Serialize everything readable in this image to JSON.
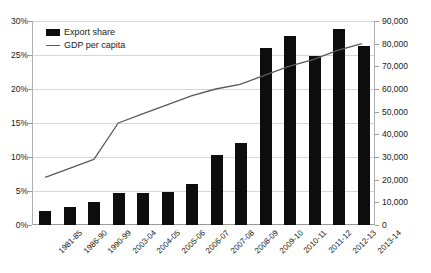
{
  "chart_data": {
    "type": "bar",
    "title": "",
    "subtitle": "",
    "xlabel": "",
    "ylabel": "",
    "y2label": "",
    "grid": true,
    "legend_position": "top-left",
    "categories": [
      "1981-85",
      "1986-90",
      "1990-99",
      "2003-04",
      "2004-05",
      "2005-06",
      "2006-07",
      "2007-08",
      "2008-09",
      "2009-10",
      "2010-11",
      "2011-12",
      "2012-13",
      "2013-14"
    ],
    "ylim": [
      0,
      30
    ],
    "yticks": [
      "0%",
      "5%",
      "10%",
      "15%",
      "20%",
      "25%",
      "30%"
    ],
    "ytick_values": [
      0,
      5,
      10,
      15,
      20,
      25,
      30
    ],
    "y2lim": [
      0,
      90000
    ],
    "y2ticks": [
      "0",
      "10,000",
      "20,000",
      "30,000",
      "40,000",
      "50,000",
      "60,000",
      "70,000",
      "80,000",
      "90,000"
    ],
    "y2tick_values": [
      0,
      10000,
      20000,
      30000,
      40000,
      50000,
      60000,
      70000,
      80000,
      90000
    ],
    "series": [
      {
        "name": "Export share",
        "kind": "bar",
        "axis": "left",
        "unit": "%",
        "color": "#0d0d0d",
        "values": [
          2.0,
          2.7,
          3.4,
          4.7,
          4.7,
          4.8,
          6.0,
          10.3,
          12.0,
          26.0,
          27.8,
          24.8,
          28.8,
          26.3
        ]
      },
      {
        "name": "GDP per capita",
        "kind": "line",
        "axis": "right",
        "unit": "",
        "color": "#5a5a5a",
        "values": [
          21000,
          25000,
          29000,
          45000,
          49000,
          53000,
          57000,
          60000,
          62000,
          66000,
          70000,
          73000,
          77000,
          80000
        ]
      }
    ]
  },
  "legend": {
    "items": [
      {
        "label": "Export share",
        "marker": "bar-swatch"
      },
      {
        "label": "GDP per capita",
        "marker": "line-swatch"
      }
    ]
  }
}
